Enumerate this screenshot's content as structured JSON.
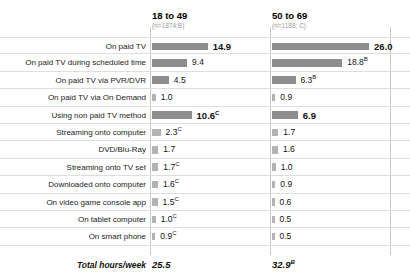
{
  "chart_data": {
    "type": "bar",
    "title": "",
    "subtitle": "",
    "xlabel": "",
    "ylabel": "",
    "grid": true,
    "legend_position": "top",
    "orientation": "horizontal",
    "value_unit": "hours per week",
    "xlim": [
      0,
      30
    ],
    "columns": [
      {
        "label": "18 to 49",
        "sublabel": "(n=1874;B)",
        "letter": "B"
      },
      {
        "label": "50 to 69",
        "sublabel": "(n=1188; C)",
        "letter": "C"
      }
    ],
    "categories": [
      "On paid TV",
      "On paid TV during scheduled time",
      "On paid TV via PVR/DVR",
      "On paid TV via On Demand",
      "Using non paid TV method",
      "Streaming onto computer",
      "DVD/Blu-Ray",
      "Streaming onto TV set",
      "Downloaded onto computer",
      "On video game console app",
      "On tablet computer",
      "On smart phone"
    ],
    "series": [
      {
        "name": "18 to 49",
        "values": [
          14.9,
          9.4,
          4.5,
          1.0,
          10.6,
          2.3,
          1.7,
          1.7,
          1.6,
          1.5,
          1.0,
          0.9
        ],
        "labels": [
          "14.9",
          "9.4",
          "4.5",
          "1.0",
          "10.6",
          "2.3",
          "1.7",
          "1.7",
          "1.6",
          "1.5",
          "1.0",
          "0.9"
        ],
        "superscripts": [
          "",
          "",
          "",
          "",
          "C",
          "C",
          "",
          "C",
          "C",
          "C",
          "C",
          "C"
        ],
        "emphasis": [
          true,
          false,
          false,
          false,
          true,
          false,
          false,
          false,
          false,
          false,
          false,
          false
        ],
        "total": "25.5",
        "total_superscript": ""
      },
      {
        "name": "50 to 69",
        "values": [
          26.0,
          18.8,
          6.3,
          0.9,
          6.9,
          1.7,
          1.6,
          1.0,
          0.9,
          0.6,
          0.5,
          0.5
        ],
        "labels": [
          "26.0",
          "18.8",
          "6.3",
          "0.9",
          "6.9",
          "1.7",
          "1.6",
          "1.0",
          "0.9",
          "0.6",
          "0.5",
          "0.5"
        ],
        "superscripts": [
          "",
          "B",
          "B",
          "",
          "",
          "",
          "",
          "",
          "",
          "",
          "",
          ""
        ],
        "emphasis": [
          true,
          false,
          false,
          false,
          true,
          false,
          false,
          false,
          false,
          false,
          false,
          false
        ],
        "total": "32.9",
        "total_superscript": "B"
      }
    ],
    "total_row_label": "Total hours/week",
    "colors": {
      "bar_dark": "#8d8d8d",
      "bar_light": "#b3b3b3",
      "gridline": "#dedede",
      "separator": "#c9c9c9",
      "text": "#1a1a1a",
      "subtext": "#9a9a9a"
    }
  }
}
